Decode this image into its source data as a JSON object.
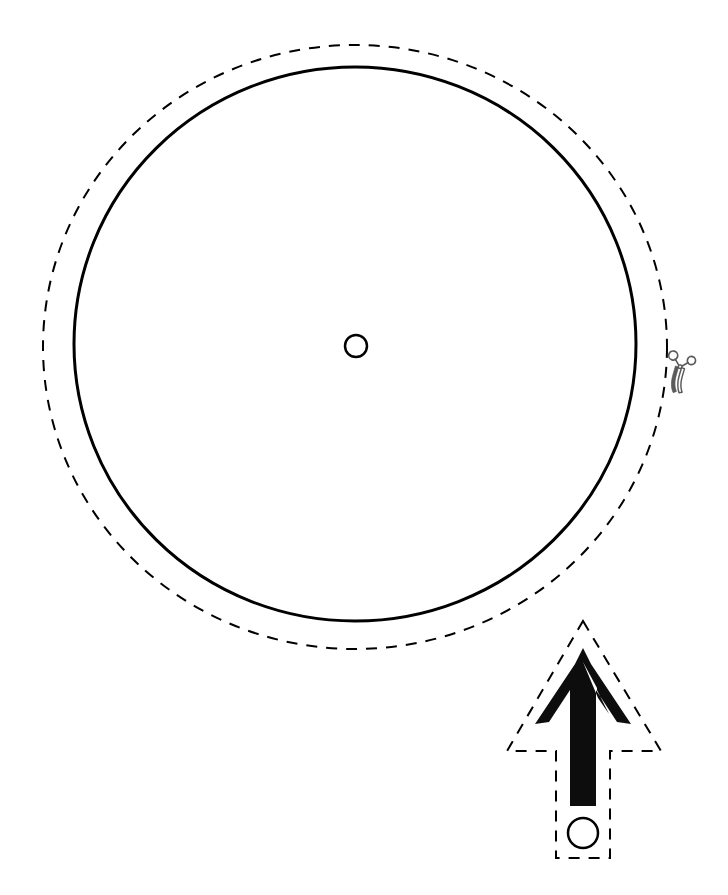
{
  "page": {
    "title": "Blank Spinner Template",
    "background_color": "#ffffff",
    "ink_color": "#000000",
    "width": 728,
    "height": 895
  },
  "spinner_wheel": {
    "name": "spinner-wheel",
    "face": {
      "label": "spinner face circle",
      "center_x": 355,
      "center_y": 344,
      "radius_x": 281,
      "radius_y": 277,
      "stroke_width": 3,
      "stroke_color": "#000000",
      "fill": "none",
      "dash": "none"
    },
    "cut_line": {
      "label": "cut along dashed line",
      "center_x": 355,
      "center_y": 347,
      "radius_x": 312,
      "radius_y": 302,
      "stroke_width": 2,
      "stroke_color": "#000000",
      "dash": "11 9"
    },
    "pivot_hole": {
      "label": "center pivot hole",
      "center_x": 356,
      "center_y": 346,
      "radius": 11,
      "stroke_width": 2.5,
      "stroke_color": "#000000",
      "fill": "none"
    }
  },
  "scissors_marker": {
    "name": "scissors-cut-marker",
    "label": "scissors",
    "icon": "scissors-icon",
    "x": 678,
    "y": 370,
    "rotation_deg": 196,
    "scale": 1.05,
    "stroke_color": "#5a5a5a",
    "stroke_width": 1.6
  },
  "spinner_arrow": {
    "name": "spinner-arrow",
    "label": "spinner needle arrow",
    "fill_color": "#0d0d0d",
    "tip_x": 583,
    "tip_y": 648,
    "base_y": 806,
    "shaft_half_width": 13,
    "head_half_width": 48,
    "head_bottom_y": 724,
    "cut_line": {
      "label": "cut along dashed line",
      "stroke_width": 2,
      "stroke_color": "#000000",
      "dash": "11 9",
      "apex_x": 583,
      "apex_y": 621,
      "left_x": 507,
      "right_x": 661,
      "shoulder_y": 751,
      "box_left_x": 556,
      "box_right_x": 610,
      "box_bottom_y": 858
    },
    "pivot_hole": {
      "label": "arrow pivot hole",
      "center_x": 583,
      "center_y": 833,
      "radius": 15,
      "stroke_width": 2.5,
      "stroke_color": "#000000",
      "fill": "none"
    }
  }
}
